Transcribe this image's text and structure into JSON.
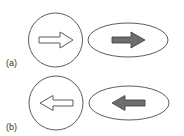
{
  "panels": [
    {
      "label": "(a)",
      "direction": "right",
      "circle": {
        "arrow": "outline",
        "arrow_icon": "arrow-right-outline-icon"
      },
      "ellipse": {
        "arrow": "filled",
        "arrow_icon": "arrow-right-filled-icon"
      }
    },
    {
      "label": "(b)",
      "direction": "left",
      "circle": {
        "arrow": "outline",
        "arrow_icon": "arrow-left-outline-icon"
      },
      "ellipse": {
        "arrow": "filled",
        "arrow_icon": "arrow-left-filled-icon"
      }
    }
  ],
  "colors": {
    "stroke": "#4a4a4a",
    "arrow_fill": "#6e6e6e",
    "outline_arrow_fill": "#ffffff",
    "background": "#ffffff"
  }
}
